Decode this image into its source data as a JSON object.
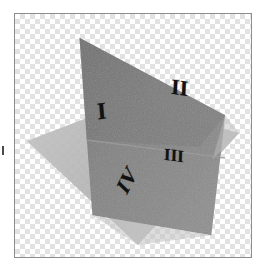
{
  "figure": {
    "background_style": "transparency-checkerboard",
    "frame_border_color": "#8d8d8d",
    "checker_light": "#ffffff",
    "checker_dark": "#e2e2e2",
    "checker_square_px": 5
  },
  "planes": [
    {
      "id": "horizontal-plane",
      "label": "horizontal plane",
      "fill": "#b4b4b4",
      "opacity": 0.92,
      "points": "26,141 125,103 240,133 138,246"
    },
    {
      "id": "vertical-plane",
      "label": "vertical plane",
      "fill": "#7c7c7c",
      "opacity": 0.95,
      "points": "79,37 226,115 212,236 92,216"
    },
    {
      "id": "horizontal-plane-front-wedge",
      "label": "horizontal plane front overlap",
      "fill": "#b9b9b9",
      "opacity": 0.62,
      "points": "92,216 212,236 138,246"
    },
    {
      "id": "vertical-plane-upper-shade",
      "label": "vertical plane upper shading",
      "fill": "#6f6f6f",
      "opacity": 0.35,
      "points": "79,37 226,115 200,147 86,140"
    }
  ],
  "intersection_line": {
    "id": "plane-intersection",
    "label": "line of intersection",
    "color": "#8a8a8a",
    "from": "86,140",
    "to": "226,158"
  },
  "labels": {
    "quadrant_1": "I",
    "quadrant_2": "II",
    "quadrant_3": "III",
    "quadrant_4": "IV"
  },
  "artifacts": {
    "edge_mark_color": "#4a4a4a"
  }
}
